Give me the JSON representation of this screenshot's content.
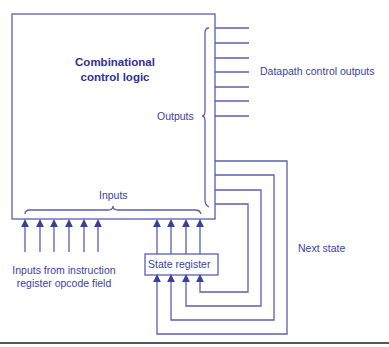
{
  "diagram": {
    "title": "Combinational control logic",
    "main_block": {
      "line1": "Combinational",
      "line2": "control logic"
    },
    "labels": {
      "outputs": "Outputs",
      "datapath_outputs": "Datapath control outputs",
      "inputs": "Inputs",
      "state_register": "State register",
      "next_state": "Next state",
      "opcode_inputs_line1": "Inputs from instruction",
      "opcode_inputs_line2": "register opcode field"
    },
    "counts": {
      "datapath_control_outputs": 7,
      "opcode_inputs": 6,
      "state_bits": 4
    },
    "colors": {
      "line": "#5a5fb0",
      "text": "#3b3f9a",
      "background": "#ffffff"
    }
  }
}
